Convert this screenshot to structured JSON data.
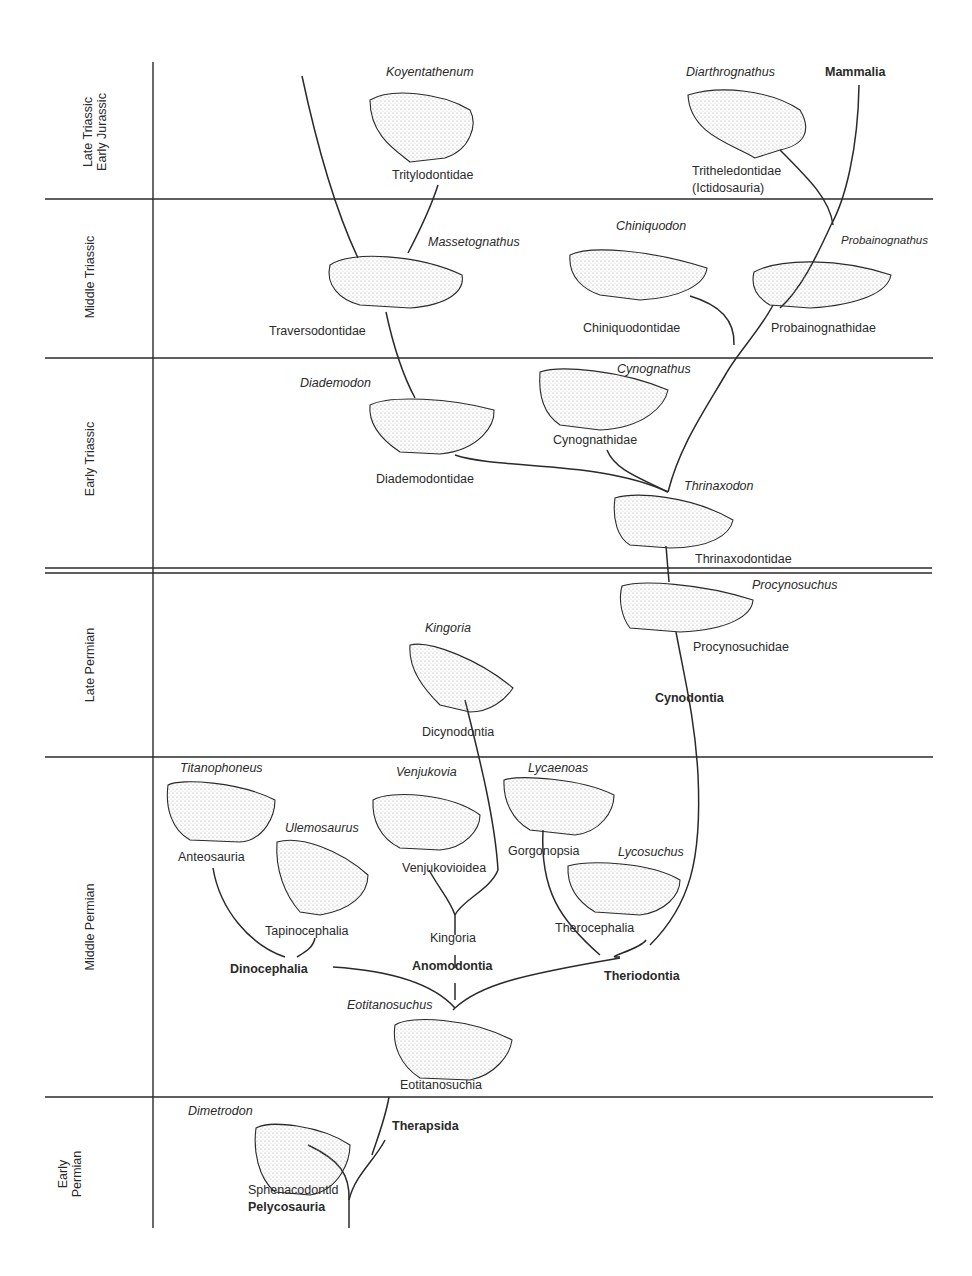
{
  "periods": [
    {
      "id": "late-triassic-early-jurassic",
      "line1": "Late Triassic",
      "line2": "Early Jurassic"
    },
    {
      "id": "middle-triassic",
      "line1": "Middle Triassic"
    },
    {
      "id": "early-triassic",
      "line1": "Early Triassic"
    },
    {
      "id": "late-permian",
      "line1": "Late Permian"
    },
    {
      "id": "middle-permian",
      "line1": "Middle Permian"
    },
    {
      "id": "early-permian",
      "line1": "Early",
      "line2": "Permian"
    }
  ],
  "genera": {
    "koyentathenum": "Koyentathenum",
    "diarthrognathus": "Diarthrognathus",
    "massetognathus": "Massetognathus",
    "chiniquodon": "Chiniquodon",
    "probainognathus": "Probainognathus",
    "diademodon": "Diademodon",
    "cynognathus": "Cynognathus",
    "thrinaxodon": "Thrinaxodon",
    "procynosuchus": "Procynosuchus",
    "kingoria": "Kingoria",
    "titanophoneus": "Titanophoneus",
    "ulemosaurus": "Ulemosaurus",
    "venjukovia": "Venjukovia",
    "lycaenoas": "Lycaenoas",
    "lycosuchus": "Lycosuchus",
    "eotitanosuchus": "Eotitanosuchus",
    "dimetrodon": "Dimetrodon"
  },
  "families": {
    "tritylodontidae": "Tritylodontidae",
    "tritheledontidae": "Tritheledontidae",
    "ictidosauria": "(Ictidosauria)",
    "traversodontidae": "Traversodontidae",
    "chiniquodontidae": "Chiniquodontidae",
    "probainognathidae": "Probainognathidae",
    "diademodontidae": "Diademodontidae",
    "cynognathidae": "Cynognathidae",
    "thrinaxodontidae": "Thrinaxodontidae",
    "procynosuchidae": "Procynosuchidae",
    "dicynodontia": "Dicynodontia",
    "anteosauria": "Anteosauria",
    "tapinocephalia": "Tapinocephalia",
    "venjukovioidea": "Venjukovioidea",
    "kingoria_group": "Kingoria",
    "gorgonopsia": "Gorgonopsia",
    "therocephalia": "Therocephalia",
    "eotitanosuchia": "Eotitanosuchia",
    "sphenacodontid": "Sphenacodontid"
  },
  "clades": {
    "mammalia": "Mammalia",
    "cynodontia": "Cynodontia",
    "dinocephalia": "Dinocephalia",
    "anomodontia": "Anomodontia",
    "theriodontia": "Theriodontia",
    "therapsida": "Therapsida",
    "pelycosauria": "Pelycosauria"
  },
  "colors": {
    "ink": "#2a2a2a",
    "paper": "#ffffff",
    "stipple": "#bdbdbd"
  }
}
